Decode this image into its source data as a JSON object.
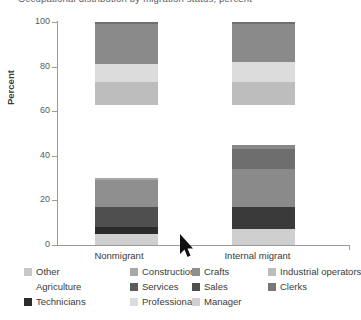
{
  "chart": {
    "title": "Occupational distribution by migration status, percent",
    "ylabel": "Percent",
    "x_categories": [
      "Nonmigrant",
      "Internal migrant"
    ],
    "y_ticks": [
      "0",
      "20",
      "40",
      "60",
      "80",
      "100"
    ]
  },
  "legend": {
    "row1": [
      {
        "label": "Other",
        "color": "#c8c8c8"
      },
      {
        "label": "Construction",
        "color": "#a8a8a8"
      },
      {
        "label": "Crafts",
        "color": "#8f8f8f"
      },
      {
        "label": "Industrial operators",
        "color": "#bdbdbd"
      }
    ],
    "row2": [
      {
        "label": "Agriculture",
        "color": "#ffffff"
      },
      {
        "label": "Services",
        "color": "#5c5c5c"
      },
      {
        "label": "Sales",
        "color": "#4f4f4f"
      },
      {
        "label": "Clerks",
        "color": "#777777"
      }
    ],
    "row3": [
      {
        "label": "Technicians",
        "color": "#2b2b2b"
      },
      {
        "label": "Professional",
        "color": "#dcdcdc"
      },
      {
        "label": "Manager",
        "color": "#cfcfcf"
      }
    ]
  },
  "chart_data": {
    "type": "bar",
    "subtype": "stacked-bar",
    "title": "Occupational distribution by migration status, percent",
    "xlabel": "",
    "ylabel": "Percent",
    "ylim": [
      0,
      100
    ],
    "yticks": [
      0,
      20,
      40,
      60,
      80,
      100
    ],
    "grid": false,
    "legend_position": "bottom",
    "categories": [
      "Nonmigrant",
      "Internal migrant"
    ],
    "series": [
      {
        "name": "Manager",
        "color": "#cfcfcf",
        "values": [
          5,
          7
        ]
      },
      {
        "name": "Technicians",
        "color": "#2b2b2b",
        "values": [
          3,
          10
        ]
      },
      {
        "name": "Sales",
        "color": "#4f4f4f",
        "values": [
          9,
          0
        ]
      },
      {
        "name": "Services",
        "color": "#5c5c5c",
        "values": [
          0,
          17
        ]
      },
      {
        "name": "Crafts",
        "color": "#8f8f8f",
        "values": [
          12,
          9
        ]
      },
      {
        "name": "Construction",
        "color": "#a8a8a8",
        "values": [
          1,
          2
        ]
      },
      {
        "name": "Agriculture",
        "color": "#ffffff",
        "values": [
          33,
          18
        ]
      },
      {
        "name": "Industrial operators",
        "color": "#bdbdbd",
        "values": [
          10,
          10
        ]
      },
      {
        "name": "Professional",
        "color": "#dcdcdc",
        "values": [
          8,
          9
        ]
      },
      {
        "name": "Clerks",
        "color": "#777777",
        "values": [
          18,
          17
        ]
      },
      {
        "name": "Other",
        "color": "#c8c8c8",
        "values": [
          1,
          1
        ]
      }
    ]
  },
  "bars": {
    "nonmigrant": [
      {
        "name": "Manager",
        "from": 0,
        "to": 5,
        "color": "#cfcfcf"
      },
      {
        "name": "Technicians",
        "from": 5,
        "to": 8,
        "color": "#2b2b2b"
      },
      {
        "name": "Sales",
        "from": 8,
        "to": 17,
        "color": "#4f4f4f"
      },
      {
        "name": "Crafts",
        "from": 17,
        "to": 29,
        "color": "#8f8f8f"
      },
      {
        "name": "Construction",
        "from": 29,
        "to": 30,
        "color": "#a8a8a8"
      },
      {
        "name": "Agriculture",
        "from": 30,
        "to": 63,
        "color": "#ffffff"
      },
      {
        "name": "Industrial operators",
        "from": 63,
        "to": 73,
        "color": "#bdbdbd"
      },
      {
        "name": "Professional",
        "from": 73,
        "to": 81,
        "color": "#dcdcdc"
      },
      {
        "name": "Clerks",
        "from": 81,
        "to": 99,
        "color": "#8a8a8a"
      },
      {
        "name": "Other",
        "from": 99,
        "to": 100,
        "color": "#6f6f6f"
      }
    ],
    "internal_migrant": [
      {
        "name": "Manager",
        "from": 0,
        "to": 7,
        "color": "#cfcfcf"
      },
      {
        "name": "Technicians",
        "from": 7,
        "to": 17,
        "color": "#3a3a3a"
      },
      {
        "name": "Services",
        "from": 17,
        "to": 34,
        "color": "#8a8a8a"
      },
      {
        "name": "Crafts",
        "from": 34,
        "to": 43,
        "color": "#6e6e6e"
      },
      {
        "name": "Construction",
        "from": 43,
        "to": 45,
        "color": "#888888"
      },
      {
        "name": "Agriculture",
        "from": 45,
        "to": 63,
        "color": "#ffffff"
      },
      {
        "name": "Industrial operators",
        "from": 63,
        "to": 73,
        "color": "#bdbdbd"
      },
      {
        "name": "Professional",
        "from": 73,
        "to": 82,
        "color": "#dcdcdc"
      },
      {
        "name": "Clerks",
        "from": 82,
        "to": 99,
        "color": "#8a8a8a"
      },
      {
        "name": "Other",
        "from": 99,
        "to": 100,
        "color": "#6f6f6f"
      }
    ]
  }
}
